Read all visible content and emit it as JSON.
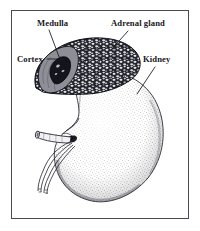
{
  "figure": {
    "kind": "anatomical-illustration",
    "frame_color": "#4a4a52",
    "background_color": "#ffffff",
    "ink_color": "#17171c"
  },
  "labels": {
    "medulla": "Medulla",
    "adrenal_gland": "Adrenal gland",
    "cortex": "Cortex",
    "kidney": "Kidney"
  },
  "structures": {
    "adrenal_gland": "adrenal-gland-shape",
    "adrenal_cortex": "adrenal-cortex-region",
    "adrenal_medulla": "adrenal-medulla-region",
    "kidney_body": "kidney-body-shape",
    "renal_hilum": "renal-hilum",
    "renal_vein": "renal-vein-tube",
    "renal_artery": "renal-artery-line",
    "ureter": "ureter-line"
  },
  "leader_lines": {
    "medulla": "leader-line-medulla",
    "adrenal_gland": "leader-line-adrenal-gland",
    "cortex": "leader-line-cortex",
    "kidney": "leader-line-kidney"
  }
}
